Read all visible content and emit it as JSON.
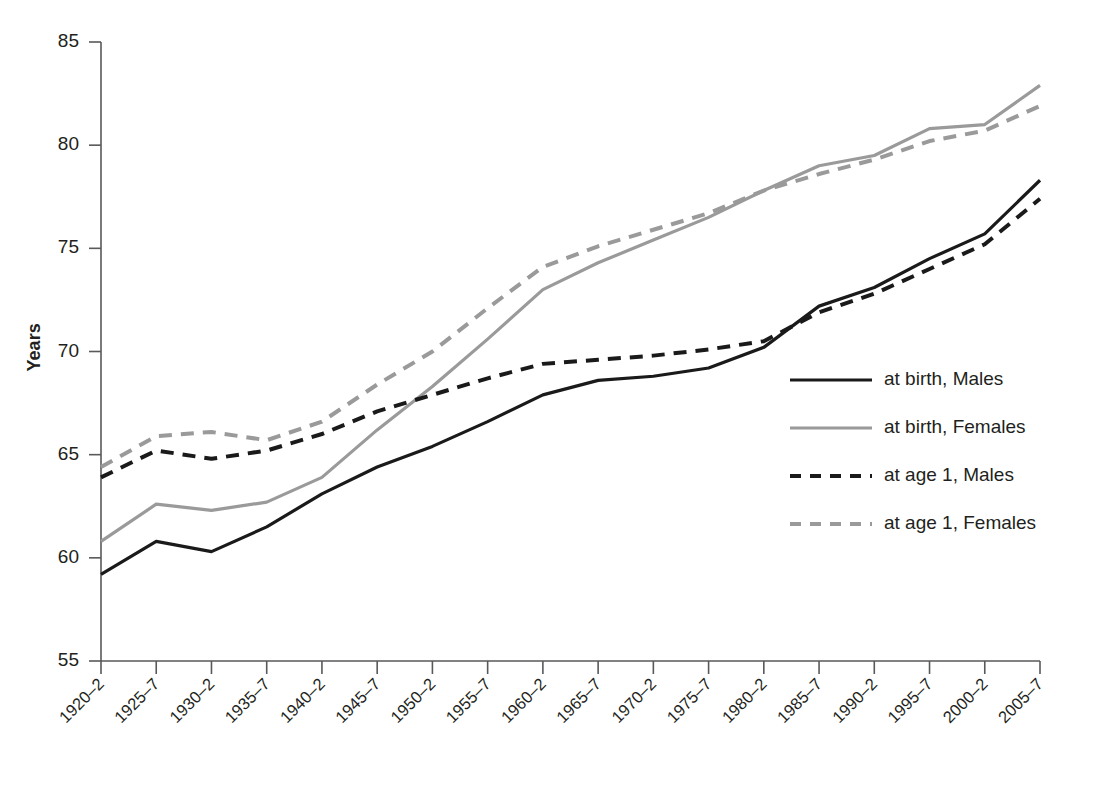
{
  "chart_data": {
    "type": "line",
    "title": "",
    "xlabel": "",
    "ylabel": "Years",
    "ylim": [
      55,
      85
    ],
    "yticks": [
      55,
      60,
      65,
      70,
      75,
      80,
      85
    ],
    "grid": false,
    "legend_position": "inside-right",
    "categories": [
      "1920–2",
      "1925–7",
      "1930–2",
      "1935–7",
      "1940–2",
      "1945–7",
      "1950–2",
      "1955–7",
      "1960–2",
      "1965–7",
      "1970–2",
      "1975–7",
      "1980–2",
      "1985–7",
      "1990–2",
      "1995–7",
      "2000–2",
      "2005–7"
    ],
    "series": [
      {
        "name": "at birth, Males",
        "color": "#1a1a1a",
        "style": "solid",
        "values": [
          59.2,
          60.8,
          60.3,
          61.5,
          63.1,
          64.4,
          65.4,
          66.6,
          67.9,
          68.6,
          68.8,
          69.2,
          70.2,
          72.2,
          73.1,
          74.5,
          75.7,
          78.3
        ]
      },
      {
        "name": "at birth, Females",
        "color": "#9a9a9a",
        "style": "solid",
        "values": [
          60.8,
          62.6,
          62.3,
          62.7,
          63.9,
          66.2,
          68.3,
          70.6,
          73.0,
          74.3,
          75.4,
          76.5,
          77.8,
          79.0,
          79.5,
          80.8,
          81.0,
          82.9
        ]
      },
      {
        "name": "at age 1, Males",
        "color": "#1a1a1a",
        "style": "dashed",
        "values": [
          63.9,
          65.2,
          64.8,
          65.2,
          66.0,
          67.1,
          67.9,
          68.7,
          69.4,
          69.6,
          69.8,
          70.1,
          70.5,
          71.9,
          72.8,
          74.0,
          75.2,
          77.4
        ]
      },
      {
        "name": "at age 1, Females",
        "color": "#9a9a9a",
        "style": "dashed",
        "values": [
          64.4,
          65.9,
          66.1,
          65.7,
          66.6,
          68.4,
          70.0,
          72.1,
          74.1,
          75.1,
          75.9,
          76.7,
          77.8,
          78.6,
          79.3,
          80.2,
          80.7,
          81.9
        ]
      }
    ]
  },
  "legend": {
    "items": [
      {
        "label": "at birth, Males",
        "color": "#1a1a1a",
        "style": "solid"
      },
      {
        "label": "at birth, Females",
        "color": "#9a9a9a",
        "style": "solid"
      },
      {
        "label": "at age 1, Males",
        "color": "#1a1a1a",
        "style": "dashed"
      },
      {
        "label": "at age 1, Females",
        "color": "#9a9a9a",
        "style": "dashed"
      }
    ]
  },
  "axes": {
    "y_title": "Years"
  },
  "geometry": {
    "plot_left": 101,
    "plot_right": 1040,
    "plot_top": 30,
    "plot_bottom": 661,
    "y_top_value": 85,
    "y_bottom_value": 55,
    "legend_x": 790,
    "legend_line_length": 82,
    "legend_text_x": 884,
    "legend_y_start": 380,
    "legend_y_step": 48
  }
}
